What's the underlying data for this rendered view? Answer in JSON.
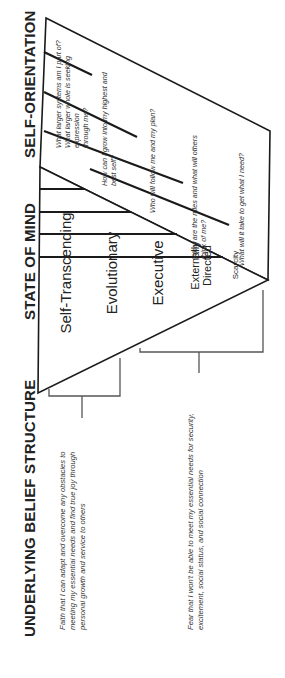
{
  "headers": {
    "self_orientation": "SELF-ORIENTATION",
    "state_of_mind": "STATE OF MIND",
    "underlying_belief": "UNDERLYING BELIEF STRUCTURE"
  },
  "self_orientation": [
    {
      "line1": "What larger systems am I part of?",
      "line2": "What larger whole is seeking expression",
      "line3": "through me?"
    },
    {
      "line1": "How can I grow into my highest and",
      "line2": "best self?"
    },
    {
      "line1": "Who will follow me and my plan?"
    },
    {
      "line1": "What are the rules and what will others",
      "line2": "think of me?"
    },
    {
      "line1": "What will it take to get what I need?"
    }
  ],
  "states_of_mind": [
    {
      "label": "Self-Transcending"
    },
    {
      "label": "Evolutionary"
    },
    {
      "label": "Executive"
    },
    {
      "line1": "Externally",
      "line2": "Directed"
    },
    {
      "label": "Scarcity"
    }
  ],
  "beliefs": [
    {
      "line1": "Faith that I can adapt and overcome any obstacles to",
      "line2": "meeting my essential needs and find true joy through",
      "line3": "personal growth and service to others"
    },
    {
      "line1": "Fear that I won't be able to meet my essential needs for security,",
      "line2": "excitement, social status, and social connection"
    }
  ],
  "colors": {
    "line": "#1a1a1a",
    "bracket": "#555555",
    "text": "#222222"
  }
}
